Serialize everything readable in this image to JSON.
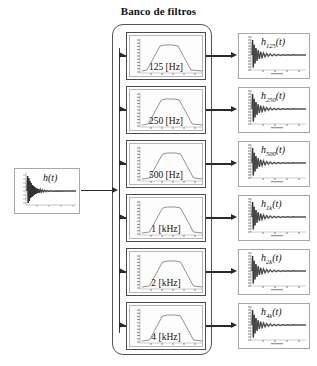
{
  "figure": {
    "title": "Banco de filtros",
    "domain": "signal-processing-block-diagram",
    "input": {
      "label": "h(t)",
      "description": "impulse response"
    },
    "bank": {
      "container_label": "Banco de filtros",
      "filters": [
        {
          "label": "125 [Hz]",
          "frequency": 125,
          "unit": "Hz",
          "center_norm": 0.46
        },
        {
          "label": "250 [Hz]",
          "frequency": 250,
          "unit": "Hz",
          "center_norm": 0.48
        },
        {
          "label": "500 [Hz]",
          "frequency": 500,
          "unit": "Hz",
          "center_norm": 0.5
        },
        {
          "label": "1 [kHz]",
          "frequency": 1,
          "unit": "kHz",
          "center_norm": 0.5
        },
        {
          "label": "2 [kHz]",
          "frequency": 2,
          "unit": "kHz",
          "center_norm": 0.5
        },
        {
          "label": "4 [kHz]",
          "frequency": 4,
          "unit": "kHz",
          "center_norm": 0.5
        }
      ]
    },
    "outputs": [
      {
        "base": "h",
        "sub": "125",
        "suffix": "(t)",
        "label": "h125(t)"
      },
      {
        "base": "h",
        "sub": "250",
        "suffix": "(t)",
        "label": "h250(t)"
      },
      {
        "base": "h",
        "sub": "500",
        "suffix": "(t)",
        "label": "h500(t)"
      },
      {
        "base": "h",
        "sub": "1k",
        "suffix": "(t)",
        "label": "h1k(t)"
      },
      {
        "base": "h",
        "sub": "2k",
        "suffix": "(t)",
        "label": "h2k(t)"
      },
      {
        "base": "h",
        "sub": "4k",
        "suffix": "(t)",
        "label": "h4k(t)"
      }
    ],
    "colors": {
      "line": "#2b2b2b",
      "frame": "#4d4d4d",
      "plot_frame": "#a8a8a8",
      "curve": "#6f6f6f",
      "signal": "#111111",
      "background": "#ffffff"
    }
  },
  "chart_data": [
    {
      "type": "line",
      "name": "input-impulse-response",
      "title": "h(t)",
      "xlabel": "",
      "ylabel": "",
      "description": "decaying oscillatory impulse response, large transient near t=0",
      "x": [
        0,
        0.02,
        0.05,
        0.09,
        0.14,
        0.2,
        0.3,
        0.45,
        0.6,
        0.8,
        1.0
      ],
      "envelope": [
        1.0,
        0.78,
        0.52,
        0.33,
        0.2,
        0.12,
        0.06,
        0.025,
        0.012,
        0.005,
        0.002
      ],
      "grid": false,
      "legend": "none"
    },
    {
      "type": "line",
      "name": "filter-magnitude-response",
      "title": "bandpass magnitude responses",
      "xlabel": "frequency",
      "ylabel": "magnitude",
      "description": "trapezoidal bandpass shape, one per filter block",
      "x": [
        0.0,
        0.18,
        0.34,
        0.42,
        0.58,
        0.66,
        0.82,
        1.0
      ],
      "values": [
        0.02,
        0.05,
        0.45,
        0.92,
        0.92,
        0.45,
        0.05,
        0.02
      ],
      "grid": false,
      "legend": "none"
    },
    {
      "type": "line",
      "name": "output-filtered-impulse-response",
      "title": "filtered impulse responses",
      "xlabel": "",
      "ylabel": "",
      "description": "band-limited decaying impulse response per output channel",
      "x": [
        0,
        0.03,
        0.06,
        0.1,
        0.16,
        0.24,
        0.35,
        0.5,
        0.7,
        1.0
      ],
      "envelope": [
        1.0,
        0.72,
        0.46,
        0.28,
        0.15,
        0.08,
        0.035,
        0.015,
        0.006,
        0.002
      ],
      "grid": false,
      "legend": "none"
    }
  ]
}
